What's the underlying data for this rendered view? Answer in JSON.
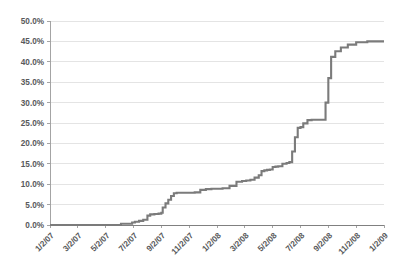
{
  "chart_data": {
    "type": "line",
    "title": "",
    "subtitle": "",
    "xlabel": "",
    "ylabel": "",
    "ylim": [
      0,
      50
    ],
    "ytick_labels": [
      "0.0%",
      "5.0%",
      "10.0%",
      "15.0%",
      "20.0%",
      "25.0%",
      "30.0%",
      "35.0%",
      "40.0%",
      "45.0%",
      "50.0%"
    ],
    "ytick_values": [
      0,
      5,
      10,
      15,
      20,
      25,
      30,
      35,
      40,
      45,
      50
    ],
    "xtick_labels": [
      "1/2/07",
      "3/2/07",
      "5/2/07",
      "7/2/07",
      "9/2/07",
      "11/2/07",
      "1/2/08",
      "3/2/08",
      "5/2/08",
      "7/2/08",
      "9/2/08",
      "11/2/08",
      "1/2/09"
    ],
    "grid": "horizontal",
    "legend": "none",
    "series": [
      {
        "name": "Cumulative Percentage",
        "color": "#7b7b7b",
        "step_style": "step-after",
        "x": [
          0.0,
          1.3,
          2.55,
          2.95,
          3.05,
          3.2,
          3.35,
          3.5,
          3.6,
          3.75,
          3.9,
          4.0,
          4.05,
          4.15,
          4.25,
          4.35,
          4.45,
          4.55,
          4.7,
          4.85,
          5.0,
          5.2,
          5.4,
          5.6,
          5.8,
          6.0,
          6.2,
          6.45,
          6.7,
          6.9,
          7.05,
          7.2,
          7.35,
          7.5,
          7.6,
          7.7,
          7.8,
          7.9,
          8.0,
          8.1,
          8.2,
          8.35,
          8.5,
          8.6,
          8.7,
          8.8,
          8.9,
          9.0,
          9.1,
          9.25,
          9.4,
          9.55,
          9.7,
          9.8,
          9.9,
          10.0,
          10.1,
          10.25,
          10.45,
          10.7,
          11.0,
          11.4,
          12.0
        ],
        "y": [
          0.0,
          0.0,
          0.3,
          0.6,
          0.8,
          1.0,
          1.3,
          2.3,
          2.6,
          2.7,
          2.8,
          3.0,
          4.3,
          5.3,
          6.2,
          7.1,
          7.8,
          7.9,
          7.9,
          7.9,
          7.9,
          8.0,
          8.6,
          8.8,
          8.9,
          8.9,
          9.0,
          9.6,
          10.6,
          10.8,
          10.9,
          11.1,
          11.6,
          12.2,
          13.2,
          13.4,
          13.5,
          13.6,
          14.2,
          14.3,
          14.4,
          15.0,
          15.2,
          15.4,
          18.0,
          21.5,
          23.8,
          24.0,
          24.9,
          25.7,
          25.8,
          25.8,
          25.8,
          25.8,
          30.0,
          36.0,
          41.2,
          42.6,
          43.5,
          44.2,
          44.8,
          45.0,
          45.0
        ]
      }
    ]
  },
  "axis": {
    "x_range_label_count": 13,
    "y_max_label": "50.0%",
    "y_min_label": "0.0%"
  }
}
